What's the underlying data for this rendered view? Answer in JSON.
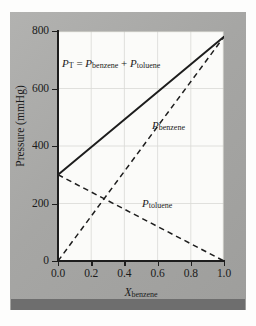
{
  "figure": {
    "name": "raoults-law-partial-pressure-diagram",
    "panel_color": "#a9a9a7",
    "plot_background": "#fbfbf9",
    "accent_line_color": "#1d1d1d",
    "grid_color": "#d8d8d4",
    "bottom_bar_color": "#6e6e6e"
  },
  "axes": {
    "y_title_main": "Pressure (mmHg)",
    "x_title_symbol": "X",
    "x_title_sub": "benzene",
    "y_ticks": [
      "800",
      "600",
      "400",
      "200",
      "0"
    ],
    "y_tick_values": [
      800,
      600,
      400,
      200,
      0
    ],
    "x_ticks": [
      "0.0",
      "0.2",
      "0.4",
      "0.6",
      "0.8",
      "1.0"
    ],
    "x_tick_values": [
      0.0,
      0.2,
      0.4,
      0.6,
      0.8,
      1.0
    ]
  },
  "annotations": {
    "total": {
      "symbol": "P",
      "sub": "T",
      "equals": " = ",
      "term1_symbol": "P",
      "term1_sub": "benzene",
      "plus": " + ",
      "term2_symbol": "P",
      "term2_sub": "toluene",
      "full_text": "P_T = P_benzene + P_toluene"
    },
    "benzene": {
      "symbol": "P",
      "sub": "benzene"
    },
    "toluene": {
      "symbol": "P",
      "sub": "toluene"
    }
  },
  "chart_data": {
    "type": "line",
    "title": "",
    "subtitle": "",
    "xlabel": "X_benzene",
    "ylabel": "Pressure (mmHg)",
    "xlim": [
      0.0,
      1.0
    ],
    "ylim": [
      0,
      800
    ],
    "xticks": [
      0.0,
      0.2,
      0.4,
      0.6,
      0.8,
      1.0
    ],
    "yticks": [
      0,
      200,
      400,
      600,
      800
    ],
    "grid": true,
    "legend": "inline-annotations",
    "series": [
      {
        "name": "P_T = P_benzene + P_toluene",
        "style": "solid",
        "color": "#1d1d1d",
        "x": [
          0.0,
          1.0
        ],
        "values": [
          300,
          780
        ]
      },
      {
        "name": "P_benzene",
        "style": "dashed",
        "color": "#1d1d1d",
        "x": [
          0.0,
          1.0
        ],
        "values": [
          0,
          780
        ]
      },
      {
        "name": "P_toluene",
        "style": "dashed",
        "color": "#1d1d1d",
        "x": [
          0.0,
          1.0
        ],
        "values": [
          300,
          0
        ]
      }
    ]
  }
}
